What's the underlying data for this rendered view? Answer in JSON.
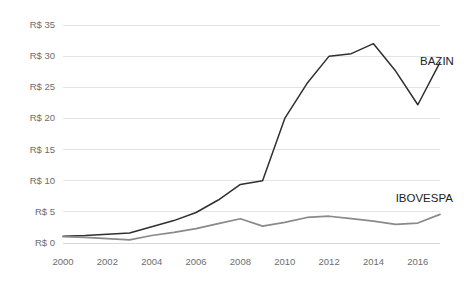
{
  "chart_data": {
    "type": "line",
    "title": "",
    "subtitle": "",
    "xlabel": "",
    "ylabel": "",
    "xlim": [
      2000,
      2017
    ],
    "ylim": [
      0,
      35
    ],
    "grid": true,
    "legend_position": "inline-right",
    "x": [
      2000,
      2001,
      2002,
      2003,
      2004,
      2005,
      2006,
      2007,
      2008,
      2009,
      2010,
      2011,
      2012,
      2013,
      2014,
      2015,
      2016,
      2017
    ],
    "x_tick_labels": [
      "2000",
      "2002",
      "2004",
      "2006",
      "2008",
      "2010",
      "2012",
      "2014",
      "2016"
    ],
    "x_tick_values": [
      2000,
      2002,
      2004,
      2006,
      2008,
      2010,
      2012,
      2014,
      2016
    ],
    "y_tick_labels": [
      "R$ 0",
      "R$ 5",
      "R$ 10",
      "R$ 15",
      "R$ 20",
      "R$ 25",
      "R$ 30",
      "R$ 35"
    ],
    "y_tick_values": [
      0,
      5,
      10,
      15,
      20,
      25,
      30,
      35
    ],
    "series": [
      {
        "name": "BAZIN",
        "color": "#2f2f2f",
        "label_x": 2016.1,
        "label_y": 28.6,
        "values": [
          1.1,
          1.2,
          1.4,
          1.6,
          2.6,
          3.6,
          4.9,
          6.9,
          9.4,
          10.0,
          20.0,
          25.6,
          30.0,
          30.4,
          32.0,
          27.6,
          22.2,
          29.0
        ]
      },
      {
        "name": "IBOVESPA",
        "color": "#8a8a8a",
        "label_x": 2015.0,
        "label_y": 6.6,
        "values": [
          1.0,
          0.9,
          0.7,
          0.5,
          1.2,
          1.7,
          2.3,
          3.1,
          3.9,
          2.7,
          3.3,
          4.1,
          4.3,
          3.9,
          3.5,
          3.0,
          3.2,
          4.6
        ]
      }
    ]
  }
}
